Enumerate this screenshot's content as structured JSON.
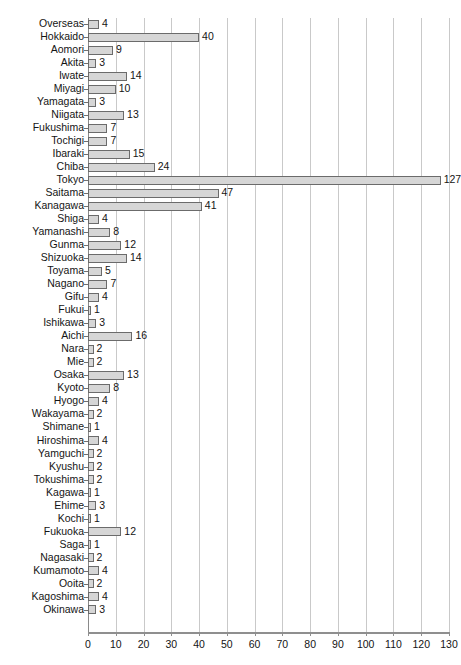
{
  "chart_data": {
    "type": "bar",
    "orientation": "horizontal",
    "title": "",
    "subtitle": "",
    "xlabel": "",
    "ylabel": "",
    "xlim": [
      0,
      130
    ],
    "xticks": [
      0,
      10,
      20,
      30,
      40,
      50,
      60,
      70,
      80,
      90,
      100,
      110,
      120,
      130
    ],
    "grid": true,
    "legend": null,
    "bar_fill_color": "#d6d6d6",
    "bar_border_color": "#6b6b6b",
    "gridline_color": "#c9c9c9",
    "axis_color": "#8f8f8f",
    "categories": [
      "Overseas",
      "Hokkaido",
      "Aomori",
      "Akita",
      "Iwate",
      "Miyagi",
      "Yamagata",
      "Niigata",
      "Fukushima",
      "Tochigi",
      "Ibaraki",
      "Chiba",
      "Tokyo",
      "Saitama",
      "Kanagawa",
      "Shiga",
      "Yamanashi",
      "Gunma",
      "Shizuoka",
      "Toyama",
      "Nagano",
      "Gifu",
      "Fukui",
      "Ishikawa",
      "Aichi",
      "Nara",
      "Mie",
      "Osaka",
      "Kyoto",
      "Hyogo",
      "Wakayama",
      "Shimane",
      "Hiroshima",
      "Yamguchi",
      "Kyushu",
      "Tokushima",
      "Kagawa",
      "Ehime",
      "Kochi",
      "Fukuoka",
      "Saga",
      "Nagasaki",
      "Kumamoto",
      "Ooita",
      "Kagoshima",
      "Okinawa"
    ],
    "values": [
      4,
      40,
      9,
      3,
      14,
      10,
      3,
      13,
      7,
      7,
      15,
      24,
      127,
      47,
      41,
      4,
      8,
      12,
      14,
      5,
      7,
      4,
      1,
      3,
      16,
      2,
      2,
      13,
      8,
      4,
      2,
      1,
      4,
      2,
      2,
      2,
      1,
      3,
      1,
      12,
      1,
      2,
      4,
      2,
      4,
      3
    ]
  }
}
